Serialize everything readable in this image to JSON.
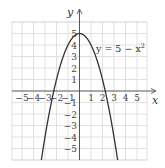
{
  "chart_data": {
    "type": "line",
    "title": "",
    "equation_label": "y = 5 − x",
    "equation_exponent": "2",
    "xlabel": "x",
    "ylabel": "y",
    "xlim": [
      -6,
      6
    ],
    "ylim": [
      -6,
      6
    ],
    "grid": true,
    "x_ticks": [
      -5,
      -4,
      -3,
      -2,
      -1,
      1,
      2,
      3,
      4,
      5
    ],
    "y_ticks": [
      5,
      4,
      3,
      2,
      1,
      -1,
      -2,
      -3,
      -4,
      -5
    ],
    "x_tick_labels": [
      "−5",
      "−4",
      "−3",
      "−2",
      "−1",
      "1",
      "2",
      "3",
      "4",
      "5"
    ],
    "y_tick_labels": [
      "5",
      "4",
      "3",
      "2",
      "1",
      "−1",
      "−2",
      "−3",
      "−4",
      "−5"
    ],
    "series": [
      {
        "name": "y = 5 − x^2",
        "function": "5 - x^2",
        "x": [
          -3.32,
          -3,
          -2.5,
          -2,
          -1.5,
          -1,
          -0.5,
          0,
          0.5,
          1,
          1.5,
          2,
          2.5,
          3,
          3.32
        ],
        "y": [
          -6.0,
          -4,
          -1.25,
          1,
          2.75,
          4,
          4.75,
          5,
          4.75,
          4,
          2.75,
          1,
          -1.25,
          -4,
          -6.0
        ]
      }
    ]
  }
}
